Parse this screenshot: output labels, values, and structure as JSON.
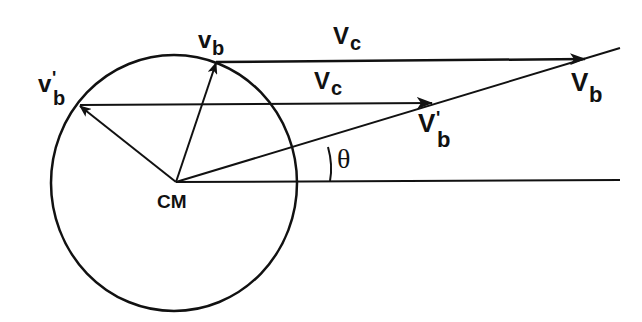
{
  "diagram": {
    "type": "vector-diagram",
    "colors": {
      "stroke": "#111111",
      "background": "#ffffff"
    },
    "labels": {
      "cm": "CM",
      "vb_small": "v",
      "vb_small_sub": "b",
      "vbp_small": "v",
      "vbp_small_prime": "'",
      "vbp_small_sub": "b",
      "vc_top": "V",
      "vc_top_sub": "c",
      "vc_mid": "V",
      "vc_mid_sub": "c",
      "vb_big": "V",
      "vb_big_sub": "b",
      "vbp_big": "V",
      "vbp_big_prime": "'",
      "vbp_big_sub": "b",
      "theta": "θ"
    }
  }
}
